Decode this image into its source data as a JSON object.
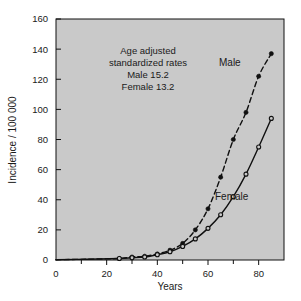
{
  "chart_data": {
    "type": "line",
    "title": "",
    "xlabel": "Years",
    "ylabel": "Incidence / 100 000",
    "xlim": [
      0,
      90
    ],
    "ylim": [
      0,
      160
    ],
    "xticks": [
      0,
      20,
      40,
      60,
      80
    ],
    "xticks_minor": [
      10,
      30,
      50,
      70
    ],
    "yticks": [
      0,
      20,
      40,
      60,
      80,
      100,
      120,
      140,
      160
    ],
    "xtick_labels": [
      "0",
      "20",
      "40",
      "60",
      "80"
    ],
    "ytick_labels": [
      "0",
      "20",
      "40",
      "60",
      "80",
      "100",
      "120",
      "140",
      "160"
    ],
    "grid": false,
    "legend_position": "inline-curve-labels",
    "plot_background": "#c9c9c9",
    "line_color": "#101010",
    "x": [
      25,
      30,
      35,
      40,
      45,
      50,
      55,
      60,
      65,
      70,
      75,
      80,
      85
    ],
    "series": [
      {
        "name": "Male",
        "label": "Male",
        "marker": "filled-circle",
        "linestyle": "dashed",
        "values": [
          1,
          2,
          2.5,
          4,
          6.5,
          11,
          20,
          34,
          55,
          80,
          98,
          122,
          137
        ]
      },
      {
        "name": "Female",
        "label": "Female",
        "marker": "open-circle",
        "linestyle": "solid",
        "values": [
          1,
          1.5,
          2,
          3.5,
          5.5,
          9,
          14,
          21,
          30,
          42,
          57,
          75,
          94
        ]
      }
    ],
    "annotations": [
      {
        "text": "Age adjusted",
        "x": 33,
        "y": 143
      },
      {
        "text": "standardized rates",
        "x": 33,
        "y": 134
      },
      {
        "text": "Male 15.2",
        "x": 33,
        "y": 125
      },
      {
        "text": "Female 13.2",
        "x": 33,
        "y": 116
      }
    ]
  },
  "annotation_block": {
    "line1": "Age adjusted",
    "line2": "standardized rates",
    "line3": "Male 15.2",
    "line4": "Female 13.2"
  },
  "labels": {
    "male": "Male",
    "female": "Female",
    "xaxis": "Years",
    "yaxis": "Incidence / 100 000"
  }
}
